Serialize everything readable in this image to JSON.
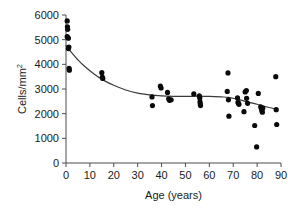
{
  "figure": {
    "background_color": "#ffffff",
    "point_color": "#0a0a0a",
    "curve_color": "#3a3a3a",
    "axis_color": "#4d4d4d"
  },
  "chart_data": {
    "type": "scatter",
    "title": "",
    "subtitle": "",
    "xlabel": "Age (years)",
    "ylabel": "Cells/mm",
    "ylabel_superscript": "2",
    "ylabel_full": "Cells/mm²",
    "xlim": [
      0,
      90
    ],
    "ylim": [
      0,
      6000
    ],
    "xticks": [
      0,
      10,
      20,
      30,
      40,
      50,
      60,
      70,
      80,
      90
    ],
    "xtick_labels": [
      "0",
      "10",
      "20",
      "30",
      "40",
      "50",
      "60",
      "70",
      "80",
      "90"
    ],
    "yticks": [
      0,
      1000,
      2000,
      3000,
      4000,
      5000,
      6000
    ],
    "ytick_labels": [
      "0",
      "1000",
      "2000",
      "3000",
      "4000",
      "5000",
      "6000"
    ],
    "grid": false,
    "legend": null,
    "legend_position": "none",
    "annotations": [],
    "marker": "filled-circle",
    "points": [
      [
        0.5,
        5760
      ],
      [
        0.6,
        5520
      ],
      [
        0.7,
        5420
      ],
      [
        0.5,
        5120
      ],
      [
        1.0,
        5060
      ],
      [
        1.2,
        4700
      ],
      [
        1.0,
        4640
      ],
      [
        1.3,
        3840
      ],
      [
        1.4,
        3760
      ],
      [
        15.0,
        3660
      ],
      [
        15.2,
        3480
      ],
      [
        15.4,
        3430
      ],
      [
        36.0,
        2680
      ],
      [
        36.2,
        2330
      ],
      [
        39.5,
        3120
      ],
      [
        39.8,
        3040
      ],
      [
        42.5,
        2860
      ],
      [
        43.0,
        2600
      ],
      [
        43.3,
        2540
      ],
      [
        44.0,
        2560
      ],
      [
        53.5,
        2800
      ],
      [
        55.8,
        2720
      ],
      [
        56.0,
        2640
      ],
      [
        56.1,
        2480
      ],
      [
        56.2,
        2400
      ],
      [
        56.3,
        2330
      ],
      [
        67.8,
        3650
      ],
      [
        67.5,
        2900
      ],
      [
        68.0,
        2560
      ],
      [
        68.2,
        1900
      ],
      [
        71.8,
        2640
      ],
      [
        72.0,
        2460
      ],
      [
        72.2,
        2420
      ],
      [
        72.4,
        2380
      ],
      [
        74.5,
        2080
      ],
      [
        75.0,
        2880
      ],
      [
        75.5,
        2940
      ],
      [
        75.6,
        2620
      ],
      [
        76.0,
        2420
      ],
      [
        79.0,
        1520
      ],
      [
        79.8,
        650
      ],
      [
        80.5,
        2820
      ],
      [
        81.5,
        2280
      ],
      [
        81.8,
        2200
      ],
      [
        82.0,
        2120
      ],
      [
        82.2,
        2060
      ],
      [
        82.4,
        2230
      ],
      [
        87.8,
        3500
      ],
      [
        88.0,
        2160
      ],
      [
        88.2,
        1560
      ]
    ],
    "fit_curve": {
      "name": "lowess-trend",
      "points": [
        [
          0.0,
          4760
        ],
        [
          2.0,
          4520
        ],
        [
          5.0,
          4180
        ],
        [
          8.0,
          3900
        ],
        [
          12.0,
          3590
        ],
        [
          16.0,
          3340
        ],
        [
          20.0,
          3150
        ],
        [
          25.0,
          2960
        ],
        [
          30.0,
          2830
        ],
        [
          35.0,
          2760
        ],
        [
          40.0,
          2720
        ],
        [
          45.0,
          2700
        ],
        [
          50.0,
          2700
        ],
        [
          55.0,
          2710
        ],
        [
          60.0,
          2700
        ],
        [
          65.0,
          2680
        ],
        [
          68.0,
          2660
        ],
        [
          71.0,
          2600
        ],
        [
          74.0,
          2530
        ],
        [
          77.0,
          2450
        ],
        [
          80.0,
          2380
        ],
        [
          83.0,
          2300
        ],
        [
          86.0,
          2230
        ],
        [
          88.5,
          2180
        ]
      ]
    }
  }
}
